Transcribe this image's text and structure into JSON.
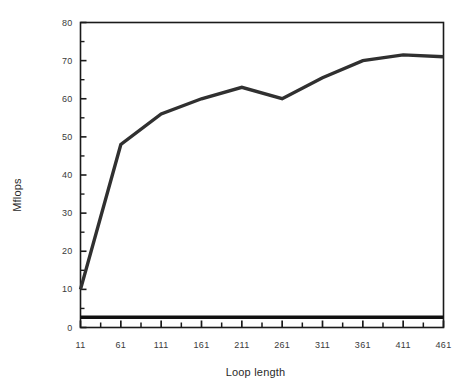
{
  "chart_data": {
    "type": "line",
    "title": "",
    "subtitle": "",
    "xlabel": "Loop length",
    "ylabel": "Mflops",
    "x": [
      11,
      61,
      111,
      161,
      211,
      261,
      311,
      361,
      411,
      461
    ],
    "xlim": [
      11,
      461
    ],
    "ylim": [
      0,
      80
    ],
    "xticks": [
      11,
      61,
      111,
      161,
      211,
      261,
      311,
      361,
      411,
      461
    ],
    "xtick_labels": [
      "11",
      "61",
      "111",
      "161",
      "211",
      "261",
      "311",
      "361",
      "411",
      "461"
    ],
    "yticks": [
      0,
      10,
      20,
      30,
      40,
      50,
      60,
      70,
      80
    ],
    "ytick_labels": [
      "0",
      "10",
      "20",
      "30",
      "40",
      "50",
      "60",
      "70",
      "80"
    ],
    "minor_xticks_between": 1,
    "minor_yticks_between": 1,
    "grid": false,
    "legend": false,
    "legend_position": "none",
    "frame": "box",
    "series": [
      {
        "name": "upper-curve",
        "color": "#303030",
        "line_width": 3.4,
        "values": [
          10,
          48,
          56,
          60,
          63,
          60,
          65.5,
          70,
          71.5,
          71
        ]
      },
      {
        "name": "lower-flat-curve",
        "color": "#101010",
        "line_width": 3.4,
        "values": [
          2.7,
          2.7,
          2.7,
          2.7,
          2.7,
          2.7,
          2.7,
          2.7,
          2.7,
          2.7
        ]
      }
    ]
  }
}
